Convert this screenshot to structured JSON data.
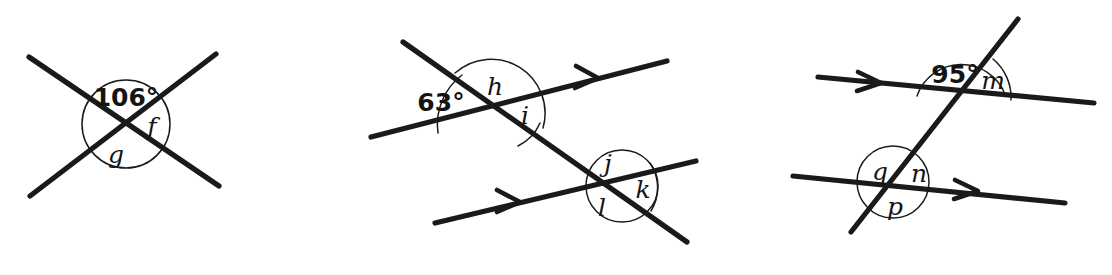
{
  "page": {
    "background_color": "#ffffff",
    "ink_color": "#1a1a1a",
    "width": 1112,
    "height": 275
  },
  "figures": [
    {
      "id": "figure-1",
      "name": "crossing-lines-vertical-angles",
      "description": "Two straight lines crossing at a point, X shape, with a circle drawn around the intersection marking three labelled angles.",
      "marked_angle_count": 3,
      "labels": [
        {
          "key": "known",
          "text": "106°",
          "kind": "value",
          "position": "top"
        },
        {
          "key": "f",
          "text": "f",
          "kind": "letter",
          "position": "right"
        },
        {
          "key": "g",
          "text": "g",
          "kind": "letter",
          "position": "bottom-left"
        }
      ],
      "parallel_marks": 0
    },
    {
      "id": "figure-2",
      "name": "transversal-two-parallel-lines-left",
      "description": "A transversal falling to the right crossing two parallel lines, each parallel line bearing a single arrowhead; angles labelled at both intersections.",
      "marked_angle_count": 6,
      "labels": [
        {
          "key": "known",
          "text": "63°",
          "kind": "value",
          "position": "upper-left"
        },
        {
          "key": "h",
          "text": "h",
          "kind": "letter",
          "position": "top"
        },
        {
          "key": "i",
          "text": "i",
          "kind": "letter",
          "position": "lower-right"
        },
        {
          "key": "j",
          "text": "j",
          "kind": "letter",
          "position": "top"
        },
        {
          "key": "k",
          "text": "k",
          "kind": "letter",
          "position": "right"
        },
        {
          "key": "l",
          "text": "l",
          "kind": "letter",
          "position": "bottom"
        }
      ],
      "parallel_marks": 2
    },
    {
      "id": "figure-3",
      "name": "transversal-two-parallel-lines-right",
      "description": "A transversal rising to the right crossing two parallel lines, each parallel line bearing a single arrowhead; angles labelled at both intersections.",
      "marked_angle_count": 5,
      "labels": [
        {
          "key": "known",
          "text": "95°",
          "kind": "value",
          "position": "top-left"
        },
        {
          "key": "m",
          "text": "m",
          "kind": "letter",
          "position": "right"
        },
        {
          "key": "q",
          "text": "q",
          "kind": "letter",
          "position": "upper-left"
        },
        {
          "key": "n",
          "text": "n",
          "kind": "letter",
          "position": "upper-right"
        },
        {
          "key": "p",
          "text": "p",
          "kind": "letter",
          "position": "bottom"
        }
      ],
      "parallel_marks": 2
    }
  ]
}
